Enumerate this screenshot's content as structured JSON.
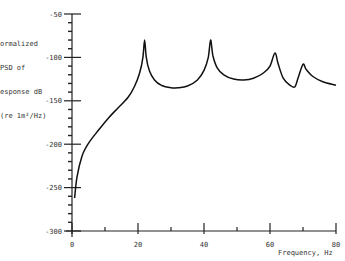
{
  "chart_data": {
    "type": "line",
    "title": "",
    "xlabel": "Frequency, Hz",
    "ylabel": "Normalized PSD of Response dB (re 1m²/Hz)",
    "ylabel_lines": [
      "ormalized",
      "PSD of",
      "esponse dB",
      "(re 1m²/Hz)"
    ],
    "xlim": [
      0,
      80
    ],
    "ylim": [
      -300,
      -50
    ],
    "x_ticks": [
      0,
      20,
      40,
      60,
      80
    ],
    "x_tick_labels": [
      "0",
      "20",
      "40",
      "60",
      "80"
    ],
    "y_ticks": [
      -50,
      -100,
      -150,
      -200,
      -250,
      -300
    ],
    "y_tick_labels": [
      "-50",
      "-100",
      "-150",
      "-200",
      "-250",
      "-300"
    ],
    "grid": false,
    "legend": null,
    "series": [
      {
        "name": "PSD",
        "color": "#111111",
        "x": [
          0.8,
          1.5,
          3,
          5,
          8,
          11,
          14,
          17,
          19,
          20.5,
          21.5,
          22,
          22.5,
          23.5,
          25,
          27,
          30,
          32,
          35,
          38,
          40,
          41.3,
          42,
          42.7,
          44,
          46,
          49,
          52,
          55,
          58,
          60,
          61.5,
          62.5,
          64,
          66,
          67.5,
          68.5,
          70,
          71,
          73,
          76,
          80
        ],
        "values": [
          -262,
          -238,
          -214,
          -199,
          -184,
          -170,
          -158,
          -146,
          -133,
          -118,
          -100,
          -80,
          -100,
          -116,
          -126,
          -132,
          -135,
          -135,
          -133,
          -126,
          -115,
          -100,
          -80,
          -98,
          -112,
          -120,
          -125,
          -126,
          -124,
          -118,
          -110,
          -95,
          -108,
          -124,
          -132,
          -134,
          -124,
          -108,
          -114,
          -122,
          -128,
          -132
        ]
      }
    ]
  }
}
